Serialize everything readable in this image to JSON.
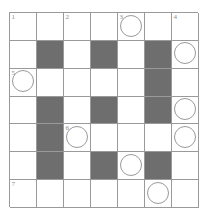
{
  "puzzle": {
    "kind": "crossword-grid",
    "rows": 7,
    "cols": 7,
    "colors": {
      "shaded_cell": "#6e6e6e",
      "empty_cell": "#ffffff",
      "grid_line": "#9a9a9a",
      "number_text": "#8a8a8a",
      "circle_stroke": "#9a9a9a",
      "page_background": "#ffffff"
    },
    "cells": [
      [
        {
          "shaded": false,
          "number": "1",
          "circled": false
        },
        {
          "shaded": false,
          "number": "",
          "circled": false
        },
        {
          "shaded": false,
          "number": "2",
          "circled": false
        },
        {
          "shaded": false,
          "number": "",
          "circled": false
        },
        {
          "shaded": false,
          "number": "3",
          "circled": true
        },
        {
          "shaded": false,
          "number": "",
          "circled": false
        },
        {
          "shaded": false,
          "number": "4",
          "circled": false
        }
      ],
      [
        {
          "shaded": false,
          "number": "",
          "circled": false
        },
        {
          "shaded": true,
          "number": "",
          "circled": false
        },
        {
          "shaded": false,
          "number": "",
          "circled": false
        },
        {
          "shaded": true,
          "number": "",
          "circled": false
        },
        {
          "shaded": false,
          "number": "",
          "circled": false
        },
        {
          "shaded": true,
          "number": "",
          "circled": false
        },
        {
          "shaded": false,
          "number": "",
          "circled": true
        }
      ],
      [
        {
          "shaded": false,
          "number": "5",
          "circled": true
        },
        {
          "shaded": false,
          "number": "",
          "circled": false
        },
        {
          "shaded": false,
          "number": "",
          "circled": false
        },
        {
          "shaded": false,
          "number": "",
          "circled": false
        },
        {
          "shaded": false,
          "number": "",
          "circled": false
        },
        {
          "shaded": true,
          "number": "",
          "circled": false
        },
        {
          "shaded": false,
          "number": "",
          "circled": false
        }
      ],
      [
        {
          "shaded": false,
          "number": "",
          "circled": false
        },
        {
          "shaded": true,
          "number": "",
          "circled": false
        },
        {
          "shaded": false,
          "number": "",
          "circled": false
        },
        {
          "shaded": true,
          "number": "",
          "circled": false
        },
        {
          "shaded": false,
          "number": "",
          "circled": false
        },
        {
          "shaded": true,
          "number": "",
          "circled": false
        },
        {
          "shaded": false,
          "number": "",
          "circled": true
        }
      ],
      [
        {
          "shaded": false,
          "number": "",
          "circled": false
        },
        {
          "shaded": true,
          "number": "",
          "circled": false
        },
        {
          "shaded": false,
          "number": "6",
          "circled": true
        },
        {
          "shaded": false,
          "number": "",
          "circled": false
        },
        {
          "shaded": false,
          "number": "",
          "circled": false
        },
        {
          "shaded": false,
          "number": "",
          "circled": false
        },
        {
          "shaded": false,
          "number": "",
          "circled": true
        }
      ],
      [
        {
          "shaded": false,
          "number": "",
          "circled": false
        },
        {
          "shaded": true,
          "number": "",
          "circled": false
        },
        {
          "shaded": false,
          "number": "",
          "circled": false
        },
        {
          "shaded": true,
          "number": "",
          "circled": false
        },
        {
          "shaded": false,
          "number": "",
          "circled": true
        },
        {
          "shaded": true,
          "number": "",
          "circled": false
        },
        {
          "shaded": false,
          "number": "",
          "circled": false
        }
      ],
      [
        {
          "shaded": false,
          "number": "7",
          "circled": false
        },
        {
          "shaded": false,
          "number": "",
          "circled": false
        },
        {
          "shaded": false,
          "number": "",
          "circled": false
        },
        {
          "shaded": false,
          "number": "",
          "circled": false
        },
        {
          "shaded": false,
          "number": "",
          "circled": false
        },
        {
          "shaded": false,
          "number": "",
          "circled": true
        },
        {
          "shaded": false,
          "number": "",
          "circled": false
        }
      ]
    ]
  }
}
